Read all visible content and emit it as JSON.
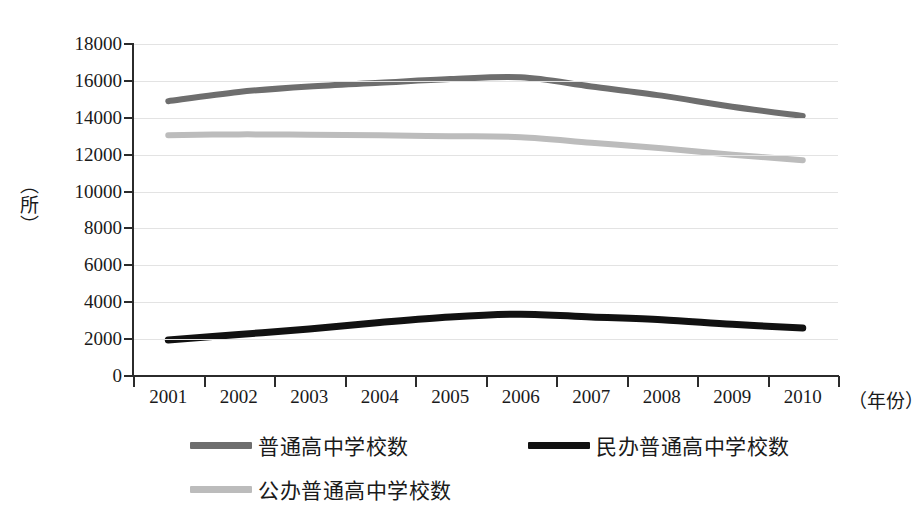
{
  "chart_data": {
    "type": "line",
    "title": "",
    "xlabel": "（年份）",
    "ylabel": "（所）",
    "categories": [
      "2001",
      "2002",
      "2003",
      "2004",
      "2005",
      "2006",
      "2007",
      "2008",
      "2009",
      "2010"
    ],
    "yticks": [
      0,
      2000,
      4000,
      6000,
      8000,
      10000,
      12000,
      14000,
      16000,
      18000
    ],
    "ylim": [
      0,
      18000
    ],
    "grid": true,
    "legend_position": "bottom",
    "series": [
      {
        "name": "普通高中学校数",
        "color": "#6e6e6e",
        "values": [
          14900,
          15400,
          15700,
          15900,
          16100,
          16200,
          15700,
          15200,
          14600,
          14100
        ]
      },
      {
        "name": "民办普通高中学校数",
        "color": "#111111",
        "values": [
          1950,
          2250,
          2550,
          2900,
          3200,
          3350,
          3200,
          3050,
          2800,
          2600
        ]
      },
      {
        "name": "公办普通高中学校数",
        "color": "#bcbcbc",
        "values": [
          13050,
          13100,
          13080,
          13050,
          13000,
          12950,
          12650,
          12350,
          12000,
          11700
        ]
      }
    ]
  },
  "axes": {
    "y_tick_labels": [
      "18000",
      "16000",
      "14000",
      "12000",
      "10000",
      "8000",
      "6000",
      "4000",
      "2000",
      "0"
    ],
    "y_axis_title": "（所）",
    "x_axis_title": "（年份）",
    "x_tick_labels": [
      "2001",
      "2002",
      "2003",
      "2004",
      "2005",
      "2006",
      "2007",
      "2008",
      "2009",
      "2010"
    ]
  },
  "legend": {
    "items": [
      {
        "label": "普通高中学校数",
        "color": "#6e6e6e"
      },
      {
        "label": "民办普通高中学校数",
        "color": "#111111"
      },
      {
        "label": "公办普通高中学校数",
        "color": "#bcbcbc"
      }
    ]
  }
}
